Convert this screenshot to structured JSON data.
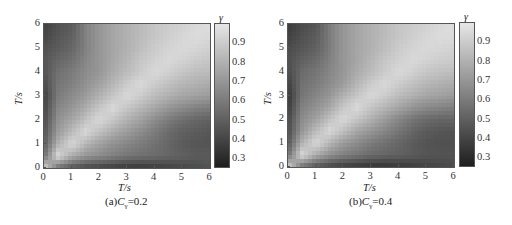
{
  "chart_data": [
    {
      "type": "heatmap",
      "title": "(a)Cγ=0.2",
      "caption_prefix": "(a)",
      "caption_var": "C",
      "caption_sub": "γ",
      "caption_value": "=0.2",
      "xlabel": "T/s",
      "ylabel": "T/s",
      "xlim": [
        0,
        6
      ],
      "ylim": [
        0,
        6
      ],
      "xticks": [
        "0",
        "1",
        "2",
        "3",
        "4",
        "5",
        "6"
      ],
      "yticks": [
        "0",
        "1",
        "2",
        "3",
        "4",
        "5",
        "6"
      ],
      "colorbar": {
        "label": "γ",
        "range": [
          0.25,
          1.0
        ],
        "ticks": [
          "0.3",
          "0.4",
          "0.5",
          "0.6",
          "0.7",
          "0.8",
          "0.9"
        ],
        "colormap": "grayscale (dark=low, light=high)"
      },
      "grid_step": 0.5,
      "x": [
        0,
        0.5,
        1,
        1.5,
        2,
        2.5,
        3,
        3.5,
        4,
        4.5,
        5,
        5.5,
        6
      ],
      "y": [
        0,
        0.5,
        1,
        1.5,
        2,
        2.5,
        3,
        3.5,
        4,
        4.5,
        5,
        5.5,
        6
      ],
      "z": [
        [
          0.95,
          0.55,
          0.45,
          0.4,
          0.38,
          0.36,
          0.34,
          0.34,
          0.36,
          0.38,
          0.4,
          0.42,
          0.44
        ],
        [
          0.55,
          0.95,
          0.78,
          0.7,
          0.66,
          0.62,
          0.58,
          0.56,
          0.54,
          0.52,
          0.5,
          0.48,
          0.48
        ],
        [
          0.48,
          0.8,
          0.95,
          0.82,
          0.74,
          0.68,
          0.64,
          0.6,
          0.56,
          0.52,
          0.48,
          0.46,
          0.45
        ],
        [
          0.45,
          0.72,
          0.84,
          0.95,
          0.86,
          0.78,
          0.72,
          0.66,
          0.6,
          0.54,
          0.5,
          0.48,
          0.46
        ],
        [
          0.42,
          0.68,
          0.76,
          0.86,
          0.95,
          0.88,
          0.8,
          0.74,
          0.66,
          0.6,
          0.55,
          0.52,
          0.5
        ],
        [
          0.4,
          0.64,
          0.7,
          0.78,
          0.88,
          0.95,
          0.88,
          0.82,
          0.76,
          0.7,
          0.66,
          0.62,
          0.6
        ],
        [
          0.38,
          0.6,
          0.66,
          0.72,
          0.8,
          0.88,
          0.95,
          0.9,
          0.84,
          0.8,
          0.76,
          0.74,
          0.72
        ],
        [
          0.42,
          0.58,
          0.62,
          0.68,
          0.74,
          0.82,
          0.9,
          0.95,
          0.9,
          0.86,
          0.82,
          0.8,
          0.78
        ],
        [
          0.45,
          0.56,
          0.6,
          0.66,
          0.7,
          0.78,
          0.84,
          0.9,
          0.95,
          0.92,
          0.88,
          0.85,
          0.84
        ],
        [
          0.46,
          0.52,
          0.56,
          0.64,
          0.7,
          0.76,
          0.82,
          0.88,
          0.92,
          0.95,
          0.93,
          0.9,
          0.88
        ],
        [
          0.44,
          0.48,
          0.52,
          0.62,
          0.7,
          0.76,
          0.8,
          0.85,
          0.9,
          0.93,
          0.95,
          0.94,
          0.92
        ],
        [
          0.4,
          0.46,
          0.5,
          0.62,
          0.7,
          0.76,
          0.8,
          0.84,
          0.88,
          0.91,
          0.94,
          0.96,
          0.95
        ],
        [
          0.38,
          0.44,
          0.48,
          0.62,
          0.7,
          0.76,
          0.8,
          0.84,
          0.88,
          0.9,
          0.92,
          0.95,
          0.97
        ]
      ]
    },
    {
      "type": "heatmap",
      "title": "(b)Cγ=0.4",
      "caption_prefix": "(b)",
      "caption_var": "C",
      "caption_sub": "γ",
      "caption_value": "=0.4",
      "xlabel": "T/s",
      "ylabel": "T/s",
      "xlim": [
        0,
        6
      ],
      "ylim": [
        0,
        6
      ],
      "xticks": [
        "0",
        "1",
        "2",
        "3",
        "4",
        "5",
        "6"
      ],
      "yticks": [
        "0",
        "1",
        "2",
        "3",
        "4",
        "5",
        "6"
      ],
      "colorbar": {
        "label": "γ",
        "range": [
          0.25,
          1.0
        ],
        "ticks": [
          "0.3",
          "0.4",
          "0.5",
          "0.6",
          "0.7",
          "0.8",
          "0.9"
        ],
        "colormap": "grayscale (dark=low, light=high)"
      },
      "grid_step": 0.5,
      "x": [
        0,
        0.5,
        1,
        1.5,
        2,
        2.5,
        3,
        3.5,
        4,
        4.5,
        5,
        5.5,
        6
      ],
      "y": [
        0,
        0.5,
        1,
        1.5,
        2,
        2.5,
        3,
        3.5,
        4,
        4.5,
        5,
        5.5,
        6
      ],
      "z": [
        [
          0.95,
          0.55,
          0.45,
          0.4,
          0.36,
          0.34,
          0.32,
          0.32,
          0.34,
          0.36,
          0.38,
          0.4,
          0.42
        ],
        [
          0.55,
          0.95,
          0.78,
          0.68,
          0.62,
          0.58,
          0.54,
          0.52,
          0.5,
          0.48,
          0.46,
          0.45,
          0.45
        ],
        [
          0.46,
          0.8,
          0.95,
          0.82,
          0.72,
          0.66,
          0.6,
          0.56,
          0.52,
          0.48,
          0.45,
          0.44,
          0.44
        ],
        [
          0.42,
          0.7,
          0.84,
          0.95,
          0.86,
          0.76,
          0.7,
          0.64,
          0.58,
          0.52,
          0.48,
          0.46,
          0.45
        ],
        [
          0.4,
          0.66,
          0.74,
          0.86,
          0.95,
          0.88,
          0.8,
          0.72,
          0.64,
          0.58,
          0.54,
          0.52,
          0.52
        ],
        [
          0.36,
          0.62,
          0.68,
          0.76,
          0.88,
          0.95,
          0.88,
          0.82,
          0.76,
          0.7,
          0.66,
          0.64,
          0.62
        ],
        [
          0.34,
          0.58,
          0.64,
          0.7,
          0.8,
          0.88,
          0.95,
          0.9,
          0.84,
          0.8,
          0.76,
          0.74,
          0.72
        ],
        [
          0.38,
          0.56,
          0.6,
          0.66,
          0.72,
          0.82,
          0.9,
          0.95,
          0.9,
          0.86,
          0.82,
          0.8,
          0.78
        ],
        [
          0.42,
          0.54,
          0.58,
          0.64,
          0.7,
          0.78,
          0.84,
          0.9,
          0.95,
          0.92,
          0.88,
          0.86,
          0.85
        ],
        [
          0.44,
          0.5,
          0.54,
          0.62,
          0.7,
          0.76,
          0.82,
          0.88,
          0.92,
          0.95,
          0.93,
          0.91,
          0.9
        ],
        [
          0.42,
          0.46,
          0.5,
          0.6,
          0.7,
          0.76,
          0.8,
          0.85,
          0.9,
          0.93,
          0.95,
          0.94,
          0.93
        ],
        [
          0.38,
          0.44,
          0.48,
          0.6,
          0.7,
          0.76,
          0.8,
          0.84,
          0.88,
          0.91,
          0.94,
          0.96,
          0.96
        ],
        [
          0.36,
          0.42,
          0.46,
          0.6,
          0.7,
          0.76,
          0.8,
          0.84,
          0.88,
          0.9,
          0.92,
          0.95,
          0.97
        ]
      ]
    }
  ]
}
